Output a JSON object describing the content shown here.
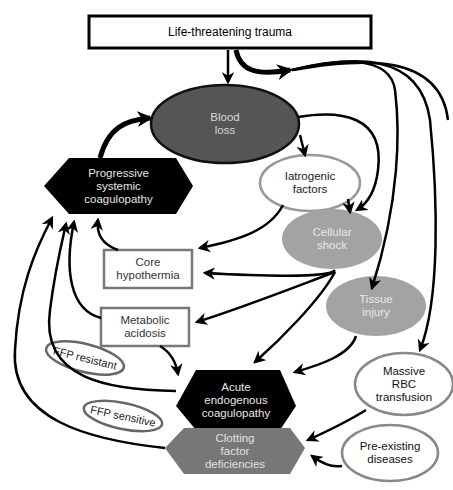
{
  "diagram": {
    "title_node": {
      "label": "Life-threatening trauma"
    },
    "nodes": {
      "blood_loss": {
        "label": "Blood\nloss",
        "shape": "ellipse",
        "fill": "#555555",
        "text_color": "#d8d8d8"
      },
      "iatrogenic": {
        "label": "Iatrogenic\nfactors",
        "shape": "ellipse",
        "fill": "#ffffff",
        "stroke": "#999999",
        "text_color": "#222222"
      },
      "progressive": {
        "label": "Progressive\nsystemic\ncoagulopathy",
        "shape": "hexagon",
        "fill": "#000000",
        "text_color": "#e6e6e6"
      },
      "cellular_shock": {
        "label": "Cellular\nshock",
        "shape": "ellipse",
        "fill": "#a3a3a3",
        "text_color": "#e8e8e8"
      },
      "core_hypothermia": {
        "label": "Core\nhypothermia",
        "shape": "rect",
        "fill": "#ffffff",
        "stroke": "#777777",
        "text_color": "#333333"
      },
      "tissue_injury": {
        "label": "Tissue\ninjury",
        "shape": "ellipse",
        "fill": "#a3a3a3",
        "text_color": "#e8e8e8"
      },
      "metabolic_acidosis": {
        "label": "Metabolic\nacidosis",
        "shape": "rect",
        "fill": "#ffffff",
        "stroke": "#777777",
        "text_color": "#333333"
      },
      "acute_endogenous": {
        "label": "Acute\nendogenous\ncoagulopathy",
        "shape": "hexagon",
        "fill": "#000000",
        "text_color": "#e6e6e6"
      },
      "massive_rbc": {
        "label": "Massive\nRBC\ntransfusion",
        "shape": "ellipse",
        "fill": "#ffffff",
        "stroke": "#888888",
        "text_color": "#111111"
      },
      "clotting_factor": {
        "label": "Clotting\nfactor\ndeficiencies",
        "shape": "hexagon",
        "fill": "#777777",
        "text_color": "#e0e0e0"
      },
      "pre_existing": {
        "label": "Pre-existing\ndiseases",
        "shape": "ellipse",
        "fill": "#ffffff",
        "stroke": "#888888",
        "text_color": "#111111"
      }
    },
    "annotations": {
      "ffp_resistant": "FFP resistant",
      "ffp_sensitive": "FFP sensitive"
    },
    "edges": [
      {
        "from": "Life-threatening trauma",
        "to": "Blood loss"
      },
      {
        "from": "Life-threatening trauma",
        "to": "Cellular shock"
      },
      {
        "from": "Life-threatening trauma",
        "to": "Tissue injury"
      },
      {
        "from": "Life-threatening trauma",
        "to": "Massive RBC transfusion"
      },
      {
        "from": "Blood loss",
        "to": "Iatrogenic factors"
      },
      {
        "from": "Blood loss",
        "to": "Cellular shock"
      },
      {
        "from": "Progressive systemic coagulopathy",
        "to": "Blood loss"
      },
      {
        "from": "Iatrogenic factors",
        "to": "Cellular shock"
      },
      {
        "from": "Iatrogenic factors",
        "to": "Core hypothermia"
      },
      {
        "from": "Cellular shock",
        "to": "Core hypothermia"
      },
      {
        "from": "Cellular shock",
        "to": "Metabolic acidosis"
      },
      {
        "from": "Cellular shock",
        "to": "Acute endogenous coagulopathy"
      },
      {
        "from": "Tissue injury",
        "to": "Acute endogenous coagulopathy"
      },
      {
        "from": "Core hypothermia",
        "to": "Progressive systemic coagulopathy"
      },
      {
        "from": "Metabolic acidosis",
        "to": "Progressive systemic coagulopathy"
      },
      {
        "from": "Metabolic acidosis",
        "to": "Acute endogenous coagulopathy"
      },
      {
        "from": "Acute endogenous coagulopathy",
        "to": "Progressive systemic coagulopathy"
      },
      {
        "from": "Clotting factor deficiencies",
        "to": "Progressive systemic coagulopathy"
      },
      {
        "from": "Massive RBC transfusion",
        "to": "Clotting factor deficiencies"
      },
      {
        "from": "Pre-existing diseases",
        "to": "Clotting factor deficiencies"
      }
    ]
  }
}
